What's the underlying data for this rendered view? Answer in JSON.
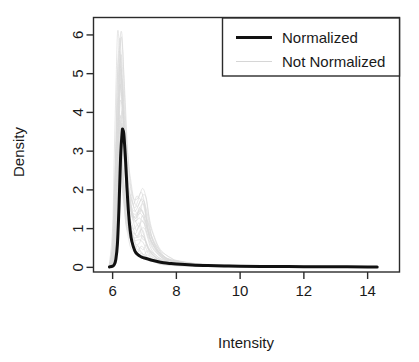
{
  "chart_data": {
    "type": "line",
    "title": "",
    "subtitle": "",
    "xlabel": "Intensity",
    "ylabel": "Density",
    "xlim": [
      5.4,
      15.0
    ],
    "ylim": [
      -0.12,
      6.45
    ],
    "xticks": [
      6,
      8,
      10,
      12,
      14
    ],
    "xticklabels": [
      "6",
      "8",
      "10",
      "12",
      "14"
    ],
    "yticks": [
      0,
      1,
      2,
      3,
      4,
      5,
      6
    ],
    "yticklabels": [
      "0",
      "1",
      "2",
      "3",
      "4",
      "5",
      "6"
    ],
    "grid": false,
    "frame": "box",
    "legend": {
      "position": "top-right",
      "border": true,
      "entries": [
        {
          "label": "Normalized",
          "color": "#111111",
          "linewidth": 3.2
        },
        {
          "label": "Not Normalized",
          "color": "#d6d6d6",
          "linewidth": 1.2
        }
      ]
    },
    "annotations": [],
    "series": [
      {
        "name": "Not Normalized",
        "kind": "density-bundle",
        "color": "#d9d9d9",
        "linewidth": 0.9,
        "n_curves": 26,
        "description": "Many overlapping unnormalized sample density curves forming a light grey band with a tall narrow primary mode near 6.2-6.4 reaching up to about 6.3 density, plus a smaller secondary shoulder near 6.9-7.1 reaching about 2.0",
        "peak_x_range": [
          6.15,
          6.45
        ],
        "peak_y_max": 6.3,
        "secondary_peak_x": 6.95,
        "secondary_peak_y": 2.05,
        "x": [
          5.95,
          6.05,
          6.1,
          6.15,
          6.2,
          6.25,
          6.3,
          6.35,
          6.4,
          6.45,
          6.5,
          6.6,
          6.7,
          6.8,
          6.9,
          7.0,
          7.1,
          7.2,
          7.4,
          7.6,
          7.8,
          8.0,
          8.5,
          9.0,
          10.0,
          11.0,
          12.0,
          13.0,
          14.0,
          14.3
        ],
        "envelope_upper": [
          0.1,
          1.2,
          3.0,
          5.1,
          6.3,
          6.0,
          5.1,
          4.1,
          3.3,
          2.75,
          2.35,
          1.9,
          1.75,
          1.9,
          2.05,
          1.85,
          1.35,
          0.95,
          0.55,
          0.34,
          0.24,
          0.18,
          0.11,
          0.08,
          0.05,
          0.035,
          0.028,
          0.022,
          0.018,
          0.015
        ],
        "envelope_lower": [
          0.0,
          0.05,
          0.3,
          1.0,
          2.1,
          2.6,
          2.4,
          1.9,
          1.4,
          1.05,
          0.8,
          0.5,
          0.35,
          0.3,
          0.3,
          0.28,
          0.22,
          0.17,
          0.1,
          0.07,
          0.05,
          0.04,
          0.03,
          0.02,
          0.012,
          0.008,
          0.006,
          0.005,
          0.004,
          0.003
        ]
      },
      {
        "name": "Normalized",
        "kind": "density",
        "color": "#111111",
        "linewidth": 3.0,
        "peak_x": 6.32,
        "peak_y": 3.55,
        "x": [
          5.9,
          6.0,
          6.05,
          6.1,
          6.15,
          6.2,
          6.25,
          6.3,
          6.32,
          6.35,
          6.4,
          6.45,
          6.5,
          6.55,
          6.6,
          6.7,
          6.8,
          6.9,
          7.0,
          7.2,
          7.4,
          7.6,
          7.8,
          8.0,
          8.5,
          9.0,
          9.5,
          10.0,
          11.0,
          12.0,
          13.0,
          14.0,
          14.3
        ],
        "y": [
          0.01,
          0.03,
          0.07,
          0.2,
          0.6,
          1.55,
          2.85,
          3.5,
          3.55,
          3.45,
          2.85,
          2.05,
          1.4,
          0.95,
          0.68,
          0.42,
          0.32,
          0.27,
          0.24,
          0.19,
          0.15,
          0.12,
          0.1,
          0.085,
          0.06,
          0.045,
          0.035,
          0.03,
          0.022,
          0.018,
          0.014,
          0.011,
          0.01
        ]
      }
    ]
  },
  "axes": {
    "x_title": "Intensity",
    "y_title": "Density"
  }
}
